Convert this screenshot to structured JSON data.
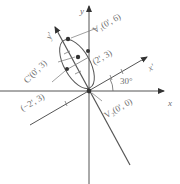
{
  "diagram": {
    "axes": {
      "x_label": "x",
      "y_label": "y",
      "x_prime_label": "x'",
      "y_prime_label": "y'"
    },
    "angle_label": "30°",
    "points": {
      "v1": "V₁(0', 6)",
      "center": "C'(0', 3)",
      "right": "(2', 3)",
      "left": "(−2', 3)",
      "v2": "V₂(0', 0)"
    },
    "colors": {
      "line": "#555555",
      "label": "#6e6e6e",
      "point": "#333333"
    }
  }
}
